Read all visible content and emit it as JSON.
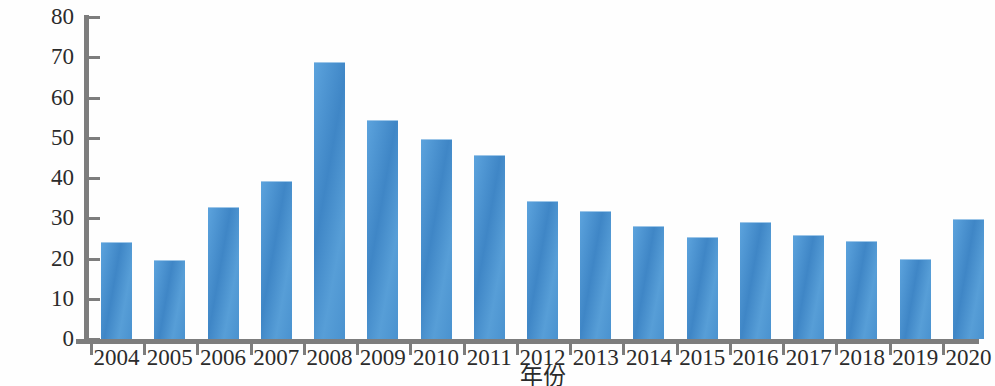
{
  "chart_data": {
    "type": "bar",
    "title": "",
    "xlabel": "年份",
    "ylabel": "金额/百万美元",
    "categories": [
      "2004",
      "2005",
      "2006",
      "2007",
      "2008",
      "2009",
      "2010",
      "2011",
      "2012",
      "2013",
      "2014",
      "2015",
      "2016",
      "2017",
      "2018",
      "2019",
      "2020"
    ],
    "values": [
      24.1,
      19.6,
      32.8,
      39.2,
      68.7,
      54.5,
      49.8,
      45.7,
      34.4,
      31.8,
      28.0,
      25.4,
      29.1,
      25.9,
      24.4,
      19.9,
      29.7
    ],
    "ylim": [
      0,
      80
    ],
    "yticks": [
      0,
      10,
      20,
      30,
      40,
      50,
      60,
      70,
      80
    ],
    "ytick_labels": [
      "0",
      "10",
      "20",
      "30",
      "40",
      "50",
      "60",
      "70",
      "80"
    ],
    "grid": false,
    "legend": null,
    "series_color": "#4a91d0",
    "axis_color": "#7d7d7d"
  }
}
